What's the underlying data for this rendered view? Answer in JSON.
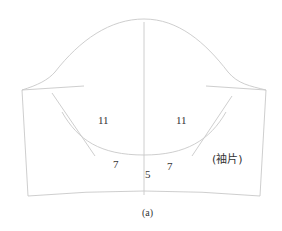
{
  "diagram": {
    "type": "sleeve-pattern",
    "labels": {
      "left_upper": "11",
      "right_upper": "11",
      "left_lower": "7",
      "right_lower": "7",
      "center": "5",
      "piece_name": "(袖片)",
      "caption": "(a)"
    },
    "colors": {
      "line": "#c8c8c8",
      "text": "#333333",
      "background": "#ffffff"
    }
  }
}
